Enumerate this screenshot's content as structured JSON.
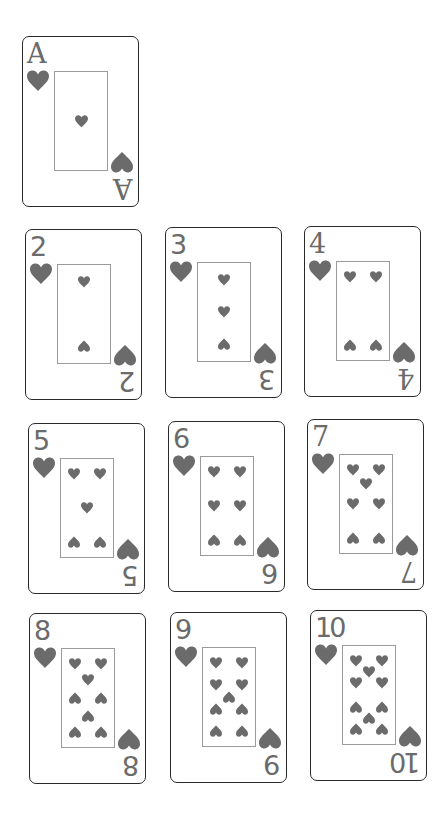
{
  "colors": {
    "suit": "#6b6b6b",
    "border": "#2a2a2a",
    "frame": "#9a9a9a"
  },
  "suit_icon": "heart-icon",
  "cards": [
    {
      "rank": "A",
      "suit": "hearts",
      "x": 22,
      "y": 36
    },
    {
      "rank": "2",
      "suit": "hearts",
      "x": 25,
      "y": 229
    },
    {
      "rank": "3",
      "suit": "hearts",
      "x": 165,
      "y": 227
    },
    {
      "rank": "4",
      "suit": "hearts",
      "x": 304,
      "y": 226
    },
    {
      "rank": "5",
      "suit": "hearts",
      "x": 28,
      "y": 423
    },
    {
      "rank": "6",
      "suit": "hearts",
      "x": 168,
      "y": 421
    },
    {
      "rank": "7",
      "suit": "hearts",
      "x": 307,
      "y": 419
    },
    {
      "rank": "8",
      "suit": "hearts",
      "x": 29,
      "y": 613
    },
    {
      "rank": "9",
      "suit": "hearts",
      "x": 170,
      "y": 612
    },
    {
      "rank": "10",
      "suit": "hearts",
      "x": 310,
      "y": 610
    }
  ]
}
